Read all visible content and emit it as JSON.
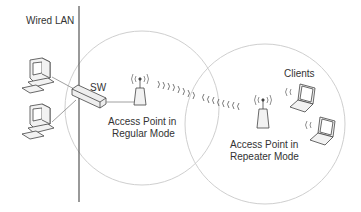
{
  "labels": {
    "wired_lan": "Wired LAN",
    "switch": "SW",
    "ap_regular_line1": "Access Point in",
    "ap_regular_line2": "Regular Mode",
    "ap_repeater_line1": "Access Point in",
    "ap_repeater_line2": "Repeater Mode",
    "clients": "Clients"
  },
  "colors": {
    "line": "#555555",
    "circle": "#c8c8c8",
    "text": "#333333",
    "device_fill": "#f2f2f2"
  }
}
